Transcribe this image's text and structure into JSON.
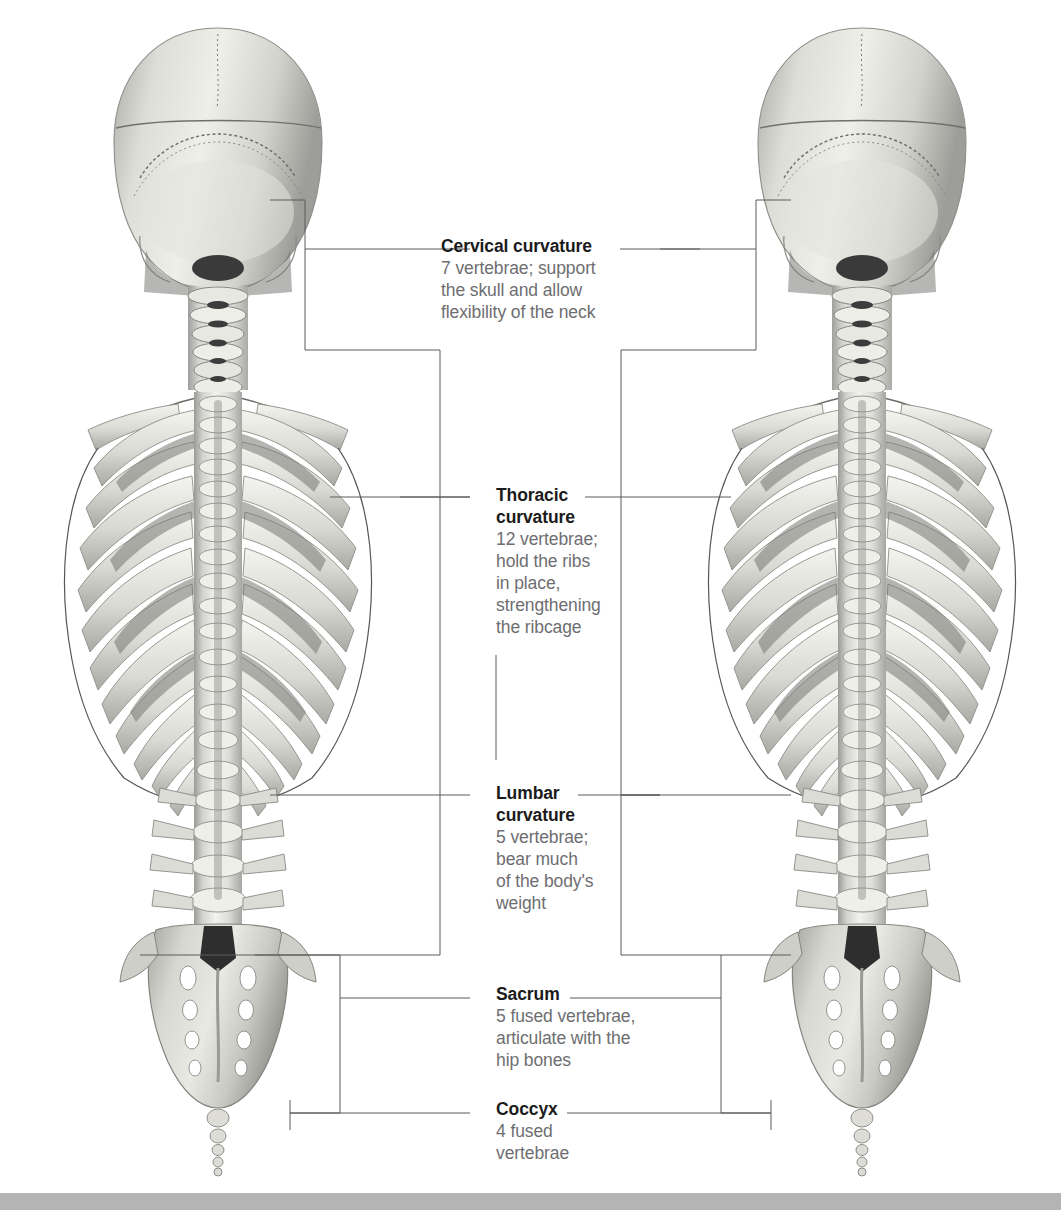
{
  "page": {
    "background_color": "#ffffff",
    "bottom_band_color": "#b4b4b4",
    "heading_color": "#1b1b1b",
    "body_text_color": "#6e6e71",
    "leader_line_color": "#5a5a5a"
  },
  "figures": [
    {
      "name": "skeleton-posterior-left",
      "description": "Posterior view of human axial skeleton: skull, cervical spine, ribcage, lumbar spine, sacrum and coccyx"
    },
    {
      "name": "skeleton-posterior-right",
      "description": "Posterior view of human axial skeleton: skull, cervical spine, ribcage, lumbar spine, sacrum and coccyx"
    }
  ],
  "callouts": [
    {
      "id": "cervical",
      "title": "Cervical curvature",
      "body": "7 vertebrae; support\nthe skull and allow\nflexibility of the neck"
    },
    {
      "id": "thoracic",
      "title": "Thoracic\ncurvature",
      "body": "12 vertebrae;\nhold the ribs\nin place,\nstrengthening\nthe ribcage"
    },
    {
      "id": "lumbar",
      "title": "Lumbar\ncurvature",
      "body": "5 vertebrae;\nbear much\nof the body's\nweight"
    },
    {
      "id": "sacrum",
      "title": "Sacrum",
      "body": "5 fused vertebrae,\narticulate with the\nhip bones"
    },
    {
      "id": "coccyx",
      "title": "Coccyx",
      "body": "4 fused\nvertebrae"
    }
  ]
}
